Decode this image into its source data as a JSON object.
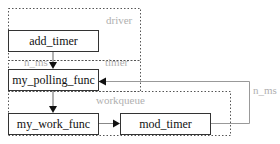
{
  "diagram": {
    "regions": [
      {
        "id": "driver",
        "label": "driver"
      },
      {
        "id": "timer",
        "label": "timer"
      },
      {
        "id": "workqueue",
        "label": "workqueue"
      }
    ],
    "nodes": [
      {
        "id": "add_timer",
        "label": "add_timer",
        "region": "driver"
      },
      {
        "id": "my_polling_func",
        "label": "my_polling_func",
        "region": "timer"
      },
      {
        "id": "my_work_func",
        "label": "my_work_func",
        "region": "workqueue"
      },
      {
        "id": "mod_timer",
        "label": "mod_timer",
        "region": "workqueue"
      }
    ],
    "edges": [
      {
        "from": "add_timer",
        "to": "my_polling_func",
        "label": "n_ms"
      },
      {
        "from": "my_polling_func",
        "to": "my_work_func",
        "label": ""
      },
      {
        "from": "my_work_func",
        "to": "mod_timer",
        "label": ""
      },
      {
        "from": "mod_timer",
        "to": "my_polling_func",
        "label": "n_ms"
      }
    ],
    "colors": {
      "box_border": "#333333",
      "region_border": "#555555",
      "region_label": "#b0b0b0",
      "loop_line": "#999999"
    }
  }
}
